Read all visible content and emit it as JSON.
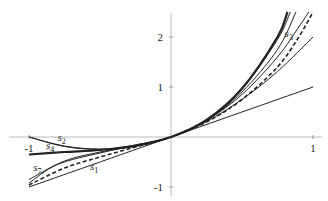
{
  "chart_data": {
    "type": "line",
    "title": "",
    "xlabel": "",
    "ylabel": "",
    "xlim": [
      -1.1,
      1.05
    ],
    "ylim": [
      -1.1,
      2.6
    ],
    "grid": false,
    "x_ticks": [
      {
        "value": -1,
        "label": "-1"
      },
      {
        "value": 1,
        "label": "1"
      }
    ],
    "y_ticks": [
      {
        "value": 2,
        "label": "2"
      },
      {
        "value": 1,
        "label": "1"
      },
      {
        "value": -1,
        "label": "-1"
      }
    ],
    "series": [
      {
        "name": "s1",
        "label": "s",
        "sub": "1",
        "style": "solid",
        "points": [
          [
            -1,
            -1
          ],
          [
            0,
            0
          ],
          [
            1,
            1
          ]
        ]
      },
      {
        "name": "s2",
        "label": "s",
        "sub": "2",
        "style": "solid",
        "points": [
          [
            -1,
            0
          ],
          [
            -0.75,
            -0.19
          ],
          [
            -0.5,
            -0.25
          ],
          [
            -0.25,
            -0.19
          ],
          [
            0,
            0
          ],
          [
            0.25,
            0.31
          ],
          [
            0.5,
            0.75
          ],
          [
            0.75,
            1.31
          ],
          [
            1,
            2
          ]
        ]
      },
      {
        "name": "s3",
        "label": "s",
        "sub": "3",
        "style": "solid",
        "points": [
          [
            -1,
            -0.85
          ],
          [
            -0.75,
            -0.48
          ],
          [
            -0.5,
            -0.3
          ],
          [
            -0.25,
            -0.16
          ],
          [
            0,
            0
          ],
          [
            0.25,
            0.33
          ],
          [
            0.5,
            0.85
          ],
          [
            0.75,
            1.6
          ],
          [
            0.9,
            2.2
          ],
          [
            0.97,
            2.5
          ]
        ]
      },
      {
        "name": "s4",
        "label": "s",
        "sub": "4",
        "style": "solid",
        "points": [
          [
            -1,
            0
          ],
          [
            -0.75,
            -0.18
          ],
          [
            -0.5,
            -0.24
          ],
          [
            -0.25,
            -0.18
          ],
          [
            0,
            0
          ],
          [
            0.25,
            0.33
          ],
          [
            0.5,
            0.9
          ],
          [
            0.75,
            1.75
          ],
          [
            0.88,
            2.5
          ]
        ]
      },
      {
        "name": "s7",
        "label": "s",
        "sub": "7",
        "style": "solid",
        "points": [
          [
            -1,
            -0.92
          ],
          [
            -0.8,
            -0.55
          ],
          [
            -0.5,
            -0.32
          ],
          [
            -0.25,
            -0.17
          ],
          [
            0,
            0
          ],
          [
            0.25,
            0.34
          ],
          [
            0.5,
            0.95
          ],
          [
            0.75,
            1.95
          ],
          [
            0.84,
            2.5
          ]
        ]
      },
      {
        "name": "thick",
        "label": "",
        "sub": "",
        "style": "thick",
        "points": [
          [
            -1,
            -0.35
          ],
          [
            -0.75,
            -0.3
          ],
          [
            -0.5,
            -0.26
          ],
          [
            -0.25,
            -0.17
          ],
          [
            0,
            0
          ],
          [
            0.25,
            0.34
          ],
          [
            0.5,
            0.97
          ],
          [
            0.75,
            2.0
          ],
          [
            0.82,
            2.5
          ]
        ]
      },
      {
        "name": "limit",
        "label": "",
        "sub": "",
        "style": "dashed",
        "points": [
          [
            -1,
            -0.96
          ],
          [
            -0.75,
            -0.62
          ],
          [
            -0.5,
            -0.4
          ],
          [
            -0.25,
            -0.2
          ],
          [
            0,
            0
          ],
          [
            0.25,
            0.3
          ],
          [
            0.5,
            0.75
          ],
          [
            0.75,
            1.4
          ],
          [
            0.9,
            2.0
          ],
          [
            1,
            2.5
          ]
        ]
      }
    ],
    "annotations": [
      {
        "text": "s",
        "sub": "3",
        "x": 0.8,
        "y": 2.0
      },
      {
        "text": "s",
        "sub": "2",
        "x": -0.8,
        "y": -0.07
      },
      {
        "text": "s",
        "sub": "4",
        "x": -0.88,
        "y": -0.24
      },
      {
        "text": "s",
        "sub": "7",
        "x": -0.97,
        "y": -0.67
      },
      {
        "text": "s",
        "sub": "1",
        "x": -0.57,
        "y": -0.65
      }
    ]
  }
}
